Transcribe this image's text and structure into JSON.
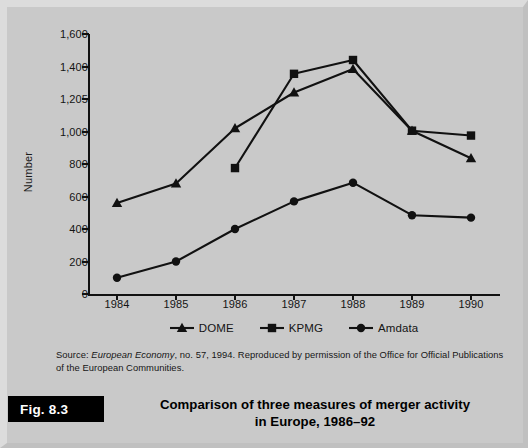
{
  "figure": {
    "number_label": "Fig. 8.3",
    "caption_line1": "Comparison of three measures of merger activity",
    "caption_line2": "in Europe, 1986–92",
    "source_prefix": "Source: ",
    "source_italic": "European Economy",
    "source_rest": ", no. 57, 1994. Reproduced by permission of the Office for Official Publications of the European Communities."
  },
  "colors": {
    "page_background": "#c9c9c9",
    "ink": "#111111",
    "caption_box": "#000000",
    "caption_text": "#ffffff"
  },
  "chart_data": {
    "type": "line",
    "title": "Comparison of three measures of merger activity in Europe, 1986–92",
    "xlabel": "",
    "ylabel": "Number",
    "categories": [
      "1984",
      "1985",
      "1986",
      "1987",
      "1988",
      "1989",
      "1990"
    ],
    "x": [
      1984,
      1985,
      1986,
      1987,
      1988,
      1989,
      1990
    ],
    "ylim": [
      0,
      1600
    ],
    "yticks": [
      0,
      200,
      400,
      600,
      800,
      1000,
      1200,
      1400,
      1600
    ],
    "ytick_labels": [
      "0",
      "200",
      "400",
      "600",
      "800",
      "1,000",
      "1,205",
      "1,400",
      "1,600"
    ],
    "grid": false,
    "legend_position": "bottom-center",
    "series": [
      {
        "name": "DOME",
        "marker": "triangle",
        "values": [
          560,
          680,
          1020,
          1240,
          1385,
          1005,
          835
        ]
      },
      {
        "name": "KPMG",
        "marker": "square",
        "values": [
          null,
          null,
          775,
          1355,
          1440,
          1005,
          975
        ]
      },
      {
        "name": "Amdata",
        "marker": "circle",
        "values": [
          100,
          200,
          400,
          570,
          685,
          485,
          470
        ]
      }
    ]
  }
}
